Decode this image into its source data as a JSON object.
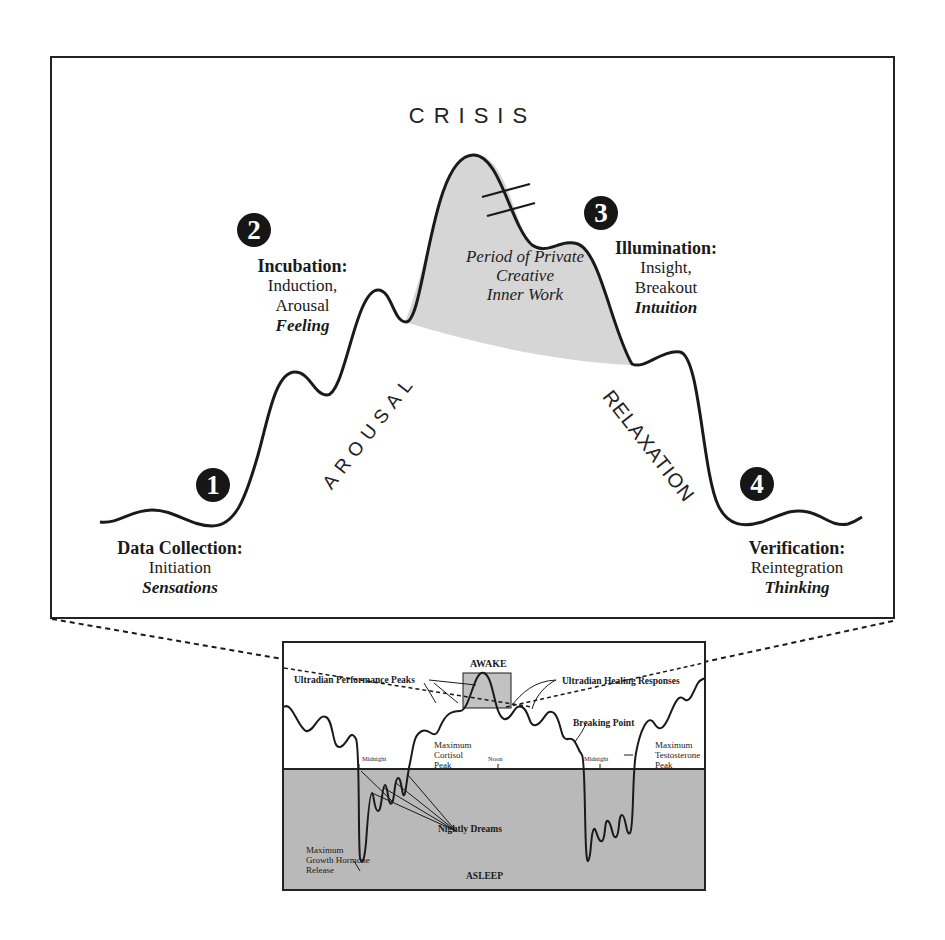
{
  "main": {
    "crisis_label": "CRISIS",
    "period_label": [
      "Period of Private",
      "Creative",
      "Inner Work"
    ],
    "arousal_label": "AROUSAL",
    "relaxation_label": "RELAXATION",
    "stages": [
      {
        "number": "1",
        "title": "Data Collection:",
        "subtitle": "Initiation",
        "mode": "Sensations"
      },
      {
        "number": "2",
        "title": "Incubation:",
        "subtitle": [
          "Induction,",
          "Arousal"
        ],
        "mode": "Feeling"
      },
      {
        "number": "3",
        "title": "Illumination:",
        "subtitle": [
          "Insight,",
          "Breakout"
        ],
        "mode": "Intuition"
      },
      {
        "number": "4",
        "title": "Verification:",
        "subtitle": "Reintegration",
        "mode": "Thinking"
      }
    ]
  },
  "inset": {
    "awake_label": "AWAKE",
    "asleep_label": "ASLEEP",
    "performance_peaks": "Ultradian Performance Peaks",
    "healing_responses": "Ultradian Healing Responses",
    "breaking_point": "Breaking Point",
    "midnight_1": "Midnight",
    "noon": "Noon",
    "midnight_2": "Midnight",
    "cortisol": [
      "Maximum",
      "Cortisol",
      "Peak"
    ],
    "testosterone": [
      "Maximum",
      "Testosterone",
      "Peak"
    ],
    "growth_hormone": [
      "Maximum",
      "Growth Hormone",
      "Release"
    ],
    "nightly_dreams": "Nightly Dreams"
  },
  "colors": {
    "line": "#1a1a1a",
    "shade": "#d4d4d4",
    "asleep_bg": "#b9b9b9",
    "awake_box": "#c2c2c2"
  }
}
